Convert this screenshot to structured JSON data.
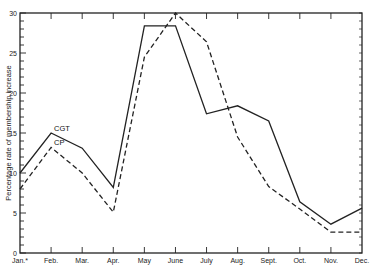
{
  "chart_data": {
    "type": "line",
    "title": "",
    "xlabel": "",
    "ylabel": "Percentage rate of membership increase",
    "categories": [
      "Jan.*",
      "Feb.",
      "Mar.",
      "Apr.",
      "May",
      "June",
      "July",
      "Aug.",
      "Sept.",
      "Oct.",
      "Nov.",
      "Dec."
    ],
    "ylim": [
      0,
      30
    ],
    "yticks": [
      0,
      5,
      10,
      15,
      20,
      25,
      30
    ],
    "grid": false,
    "legend": "inline labels",
    "series": [
      {
        "name": "CGT",
        "style": "solid",
        "values": [
          10,
          15,
          13.1,
          8.2,
          28.4,
          28.4,
          17.4,
          18.4,
          16.5,
          6.4,
          3.6,
          5.6
        ]
      },
      {
        "name": "CP",
        "style": "dashed",
        "values": [
          8,
          13.2,
          10,
          5.1,
          24.5,
          30,
          26.4,
          14.5,
          8.3,
          5.5,
          2.6,
          2.6
        ]
      }
    ]
  },
  "colors": {
    "line": "#222222",
    "axis": "#222222",
    "background": "#ffffff"
  }
}
